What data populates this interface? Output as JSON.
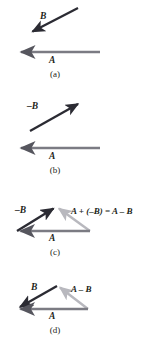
{
  "figure": {
    "width": 153,
    "height": 355,
    "background": "#ffffff",
    "colors": {
      "dark_vector": "#2b2b33",
      "gray_vector": "#7b7b83",
      "light_vector": "#b8b8be",
      "text": "#231f20"
    }
  },
  "panels": [
    {
      "id": "a",
      "caption": "(a)",
      "labels": {
        "b": "B",
        "a": "A"
      },
      "vectors": [
        {
          "name": "B",
          "color": "#2b2b33",
          "from": [
            78,
            8
          ],
          "to": [
            30,
            33
          ],
          "description": "B points down and to the left"
        },
        {
          "name": "A",
          "color": "#7b7b83",
          "from": [
            100,
            52
          ],
          "to": [
            18,
            52
          ],
          "description": "A points to the left, horizontal"
        }
      ]
    },
    {
      "id": "b",
      "caption": "(b)",
      "labels": {
        "b": "–B",
        "a": "A"
      },
      "vectors": [
        {
          "name": "-B",
          "color": "#2b2b33",
          "from": [
            30,
            131
          ],
          "to": [
            81,
            102
          ],
          "description": "negative B points up and to the right"
        },
        {
          "name": "A",
          "color": "#7b7b83",
          "from": [
            100,
            148
          ],
          "to": [
            18,
            148
          ],
          "description": "A points to the left, horizontal"
        }
      ]
    },
    {
      "id": "c",
      "caption": "(c)",
      "labels": {
        "b": "–B",
        "a": "A",
        "result": "A + (–B) = A – B"
      },
      "vectors": [
        {
          "name": "-B",
          "color": "#2b2b33",
          "from": [
            17,
            231
          ],
          "to": [
            56,
            207
          ],
          "description": "negative B from tail of A up to apex"
        },
        {
          "name": "A",
          "color": "#7b7b83",
          "from": [
            90,
            231
          ],
          "to": [
            17,
            231
          ],
          "description": "A along bottom pointing left"
        },
        {
          "name": "A + (-B)",
          "color": "#b8b8be",
          "from": [
            90,
            231
          ],
          "to": [
            57,
            207
          ],
          "description": "resultant from tail of A to head of -B"
        }
      ]
    },
    {
      "id": "d",
      "caption": "(d)",
      "labels": {
        "b": "B",
        "a": "A",
        "result": "A – B"
      },
      "vectors": [
        {
          "name": "B",
          "color": "#2b2b33",
          "from": [
            57,
            286
          ],
          "to": [
            17,
            309
          ],
          "description": "B from apex down-left to the tail point"
        },
        {
          "name": "A",
          "color": "#7b7b83",
          "from": [
            88,
            309
          ],
          "to": [
            17,
            309
          ],
          "description": "A along bottom pointing left"
        },
        {
          "name": "A - B",
          "color": "#b8b8be",
          "from": [
            88,
            309
          ],
          "to": [
            58,
            286
          ],
          "description": "resultant A minus B"
        }
      ]
    }
  ]
}
